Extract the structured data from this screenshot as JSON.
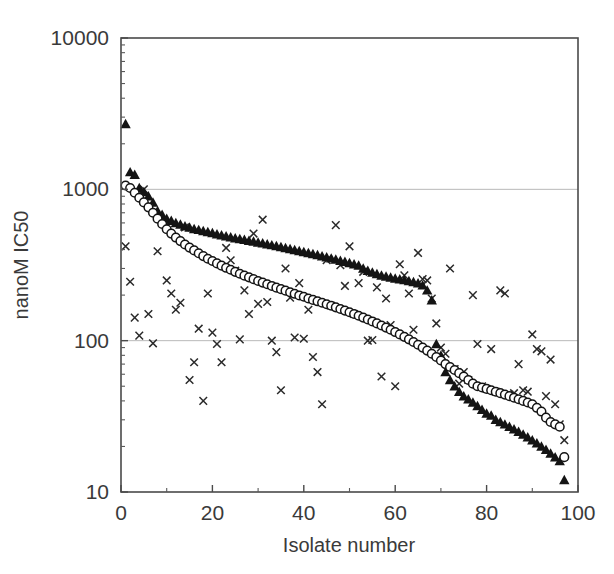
{
  "chart_data": {
    "type": "scatter",
    "title": "",
    "xlabel": "Isolate number",
    "ylabel": "nanoM IC50",
    "xlim": [
      0,
      100
    ],
    "ylim": [
      10,
      10000
    ],
    "yscale": "log",
    "xticks": [
      0,
      20,
      40,
      60,
      80,
      100
    ],
    "xticklabels": [
      "0",
      "20",
      "40",
      "60",
      "80",
      "100"
    ],
    "yticks": [
      10,
      100,
      1000,
      10000
    ],
    "yticklabels": [
      "10",
      "100",
      "1000",
      "10000"
    ],
    "grid": "horizontal-major-only",
    "legend": "none",
    "series": [
      {
        "name": "filled-triangle",
        "marker": "triangle",
        "color": "#141414",
        "points": [
          [
            1,
            2700
          ],
          [
            2,
            1300
          ],
          [
            3,
            1250
          ],
          [
            4,
            1020
          ],
          [
            5,
            960
          ],
          [
            6,
            900
          ],
          [
            7,
            820
          ],
          [
            8,
            720
          ],
          [
            9,
            680
          ],
          [
            10,
            640
          ],
          [
            11,
            620
          ],
          [
            12,
            600
          ],
          [
            13,
            585
          ],
          [
            14,
            570
          ],
          [
            15,
            560
          ],
          [
            16,
            548
          ],
          [
            17,
            540
          ],
          [
            18,
            530
          ],
          [
            19,
            522
          ],
          [
            20,
            515
          ],
          [
            21,
            505
          ],
          [
            22,
            498
          ],
          [
            23,
            490
          ],
          [
            24,
            482
          ],
          [
            25,
            476
          ],
          [
            26,
            470
          ],
          [
            27,
            464
          ],
          [
            28,
            458
          ],
          [
            29,
            452
          ],
          [
            30,
            446
          ],
          [
            31,
            440
          ],
          [
            32,
            434
          ],
          [
            33,
            428
          ],
          [
            34,
            422
          ],
          [
            35,
            416
          ],
          [
            36,
            410
          ],
          [
            37,
            404
          ],
          [
            38,
            398
          ],
          [
            39,
            392
          ],
          [
            40,
            386
          ],
          [
            41,
            380
          ],
          [
            42,
            374
          ],
          [
            43,
            368
          ],
          [
            44,
            362
          ],
          [
            45,
            356
          ],
          [
            46,
            350
          ],
          [
            47,
            344
          ],
          [
            48,
            338
          ],
          [
            49,
            332
          ],
          [
            50,
            326
          ],
          [
            51,
            320
          ],
          [
            52,
            314
          ],
          [
            53,
            300
          ],
          [
            54,
            290
          ],
          [
            55,
            282
          ],
          [
            56,
            276
          ],
          [
            57,
            270
          ],
          [
            58,
            266
          ],
          [
            59,
            262
          ],
          [
            60,
            258
          ],
          [
            61,
            255
          ],
          [
            62,
            252
          ],
          [
            63,
            248
          ],
          [
            64,
            244
          ],
          [
            65,
            240
          ],
          [
            66,
            232
          ],
          [
            67,
            215
          ],
          [
            68,
            185
          ],
          [
            69,
            95
          ],
          [
            70,
            80
          ],
          [
            71,
            62
          ],
          [
            72,
            55
          ],
          [
            73,
            50
          ],
          [
            74,
            46
          ],
          [
            75,
            43
          ],
          [
            76,
            41
          ],
          [
            77,
            39
          ],
          [
            78,
            37
          ],
          [
            79,
            35
          ],
          [
            80,
            33
          ],
          [
            81,
            32
          ],
          [
            82,
            30
          ],
          [
            83,
            29
          ],
          [
            84,
            28
          ],
          [
            85,
            27
          ],
          [
            86,
            26
          ],
          [
            87,
            25
          ],
          [
            88,
            24
          ],
          [
            89,
            23
          ],
          [
            90,
            22
          ],
          [
            91,
            21
          ],
          [
            92,
            20
          ],
          [
            93,
            19
          ],
          [
            94,
            18
          ],
          [
            95,
            17
          ],
          [
            96,
            16
          ],
          [
            97,
            12
          ]
        ]
      },
      {
        "name": "open-circle",
        "marker": "circle",
        "color": "#ffffff",
        "points": [
          [
            1,
            1060
          ],
          [
            2,
            1020
          ],
          [
            3,
            950
          ],
          [
            4,
            880
          ],
          [
            5,
            820
          ],
          [
            6,
            760
          ],
          [
            7,
            700
          ],
          [
            8,
            640
          ],
          [
            9,
            590
          ],
          [
            10,
            545
          ],
          [
            11,
            510
          ],
          [
            12,
            480
          ],
          [
            13,
            455
          ],
          [
            14,
            432
          ],
          [
            15,
            412
          ],
          [
            16,
            395
          ],
          [
            17,
            378
          ],
          [
            18,
            362
          ],
          [
            19,
            348
          ],
          [
            20,
            336
          ],
          [
            21,
            324
          ],
          [
            22,
            313
          ],
          [
            23,
            303
          ],
          [
            24,
            294
          ],
          [
            25,
            285
          ],
          [
            26,
            277
          ],
          [
            27,
            269
          ],
          [
            28,
            262
          ],
          [
            29,
            255
          ],
          [
            30,
            248
          ],
          [
            31,
            242
          ],
          [
            32,
            236
          ],
          [
            33,
            230
          ],
          [
            34,
            224
          ],
          [
            35,
            219
          ],
          [
            36,
            214
          ],
          [
            37,
            209
          ],
          [
            38,
            204
          ],
          [
            39,
            199
          ],
          [
            40,
            195
          ],
          [
            41,
            190
          ],
          [
            42,
            186
          ],
          [
            43,
            182
          ],
          [
            44,
            178
          ],
          [
            45,
            174
          ],
          [
            46,
            170
          ],
          [
            47,
            166
          ],
          [
            48,
            162
          ],
          [
            49,
            158
          ],
          [
            50,
            154
          ],
          [
            51,
            150
          ],
          [
            52,
            146
          ],
          [
            53,
            142
          ],
          [
            54,
            138
          ],
          [
            55,
            134
          ],
          [
            56,
            130
          ],
          [
            57,
            126
          ],
          [
            58,
            122
          ],
          [
            59,
            118
          ],
          [
            60,
            114
          ],
          [
            61,
            110
          ],
          [
            62,
            106
          ],
          [
            63,
            102
          ],
          [
            64,
            98
          ],
          [
            65,
            94
          ],
          [
            66,
            90
          ],
          [
            67,
            86
          ],
          [
            68,
            82
          ],
          [
            69,
            78
          ],
          [
            70,
            74
          ],
          [
            71,
            70
          ],
          [
            72,
            67
          ],
          [
            73,
            64
          ],
          [
            74,
            61
          ],
          [
            75,
            58
          ],
          [
            76,
            55
          ],
          [
            77,
            52
          ],
          [
            78,
            50
          ],
          [
            79,
            49
          ],
          [
            80,
            48
          ],
          [
            81,
            47
          ],
          [
            82,
            46
          ],
          [
            83,
            45
          ],
          [
            84,
            44
          ],
          [
            85,
            43
          ],
          [
            86,
            42
          ],
          [
            87,
            41
          ],
          [
            88,
            40
          ],
          [
            89,
            39
          ],
          [
            90,
            38
          ],
          [
            91,
            36
          ],
          [
            92,
            34
          ],
          [
            93,
            31
          ],
          [
            94,
            29
          ],
          [
            95,
            28
          ],
          [
            96,
            27
          ],
          [
            97,
            17
          ]
        ]
      },
      {
        "name": "cross",
        "marker": "x",
        "color": "#2a2a2a",
        "points": [
          [
            1,
            420
          ],
          [
            2,
            245
          ],
          [
            3,
            142
          ],
          [
            4,
            108
          ],
          [
            5,
            1000
          ],
          [
            6,
            150
          ],
          [
            7,
            96
          ],
          [
            8,
            390
          ],
          [
            9,
            615
          ],
          [
            10,
            250
          ],
          [
            11,
            205
          ],
          [
            12,
            160
          ],
          [
            13,
            178
          ],
          [
            14,
            560
          ],
          [
            15,
            55
          ],
          [
            16,
            72
          ],
          [
            17,
            120
          ],
          [
            18,
            40
          ],
          [
            19,
            205
          ],
          [
            20,
            113
          ],
          [
            21,
            95
          ],
          [
            22,
            72
          ],
          [
            23,
            410
          ],
          [
            24,
            340
          ],
          [
            25,
            290
          ],
          [
            26,
            102
          ],
          [
            27,
            215
          ],
          [
            28,
            150
          ],
          [
            29,
            510
          ],
          [
            30,
            175
          ],
          [
            31,
            630
          ],
          [
            32,
            180
          ],
          [
            33,
            100
          ],
          [
            34,
            84
          ],
          [
            35,
            47
          ],
          [
            36,
            300
          ],
          [
            37,
            192
          ],
          [
            38,
            105
          ],
          [
            39,
            240
          ],
          [
            40,
            103
          ],
          [
            41,
            160
          ],
          [
            42,
            78
          ],
          [
            43,
            62
          ],
          [
            44,
            38
          ],
          [
            45,
            340
          ],
          [
            46,
            170
          ],
          [
            47,
            580
          ],
          [
            48,
            315
          ],
          [
            49,
            230
          ],
          [
            50,
            420
          ],
          [
            51,
            150
          ],
          [
            52,
            240
          ],
          [
            53,
            285
          ],
          [
            54,
            100
          ],
          [
            55,
            101
          ],
          [
            56,
            225
          ],
          [
            57,
            58
          ],
          [
            58,
            190
          ],
          [
            59,
            127
          ],
          [
            60,
            50
          ],
          [
            61,
            320
          ],
          [
            62,
            270
          ],
          [
            63,
            205
          ],
          [
            64,
            118
          ],
          [
            65,
            380
          ],
          [
            66,
            255
          ],
          [
            67,
            250
          ],
          [
            68,
            190
          ],
          [
            69,
            130
          ],
          [
            70,
            90
          ],
          [
            71,
            82
          ],
          [
            72,
            300
          ],
          [
            73,
            65
          ],
          [
            74,
            52
          ],
          [
            75,
            62
          ],
          [
            76,
            55
          ],
          [
            77,
            200
          ],
          [
            78,
            95
          ],
          [
            79,
            50
          ],
          [
            80,
            48
          ],
          [
            81,
            88
          ],
          [
            82,
            46
          ],
          [
            83,
            215
          ],
          [
            84,
            205
          ],
          [
            85,
            44
          ],
          [
            86,
            45
          ],
          [
            87,
            70
          ],
          [
            88,
            47
          ],
          [
            89,
            46
          ],
          [
            90,
            110
          ],
          [
            91,
            88
          ],
          [
            92,
            85
          ],
          [
            93,
            43
          ],
          [
            94,
            75
          ],
          [
            95,
            38
          ],
          [
            96,
            28
          ],
          [
            97,
            22
          ]
        ]
      }
    ]
  },
  "axes": {
    "x_title": "Isolate number",
    "y_title": "nanoM IC50"
  }
}
